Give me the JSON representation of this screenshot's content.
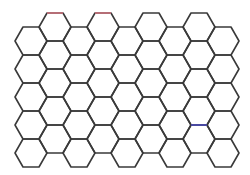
{
  "diagram": {
    "type": "hexagonal-grid",
    "orientation": "flat-top",
    "columns": 9,
    "hexes_per_column": 5,
    "hex_width": 32,
    "hex_height": 28,
    "origin_x": 15,
    "column_step": 24,
    "even_column_top": 27,
    "odd_column_top": 13,
    "stroke_color": "#3a3a3a",
    "stroke_width": 1.6,
    "background": "#ffffff",
    "highlighted_edges": [
      {
        "x1": 47,
        "y1": 13,
        "x2": 63,
        "y2": 13,
        "color": "#c9707a"
      },
      {
        "x1": 95,
        "y1": 13,
        "x2": 111,
        "y2": 13,
        "color": "#c9707a"
      },
      {
        "x1": 191,
        "y1": 125,
        "x2": 207,
        "y2": 125,
        "color": "#4a4ab8"
      }
    ]
  }
}
